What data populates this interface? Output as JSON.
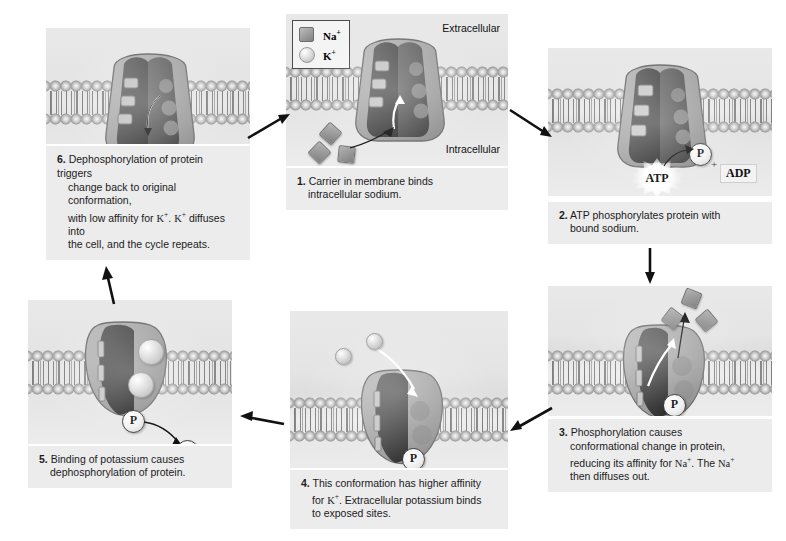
{
  "figure": {
    "legend": {
      "na_label": "Na",
      "na_charge": "+",
      "k_label": "K",
      "k_charge": "+",
      "na_icon": "square-icon",
      "k_icon": "circle-icon"
    },
    "region_labels": {
      "extracellular": "Extracellular",
      "intracellular": "Intracellular"
    },
    "molecules": {
      "atp": "ATP",
      "adp": "ADP",
      "phosphate": "P",
      "plus": "+"
    }
  },
  "steps": [
    {
      "number": "1.",
      "line1": "Carrier in membrane binds",
      "line2": "intracellular sodium.",
      "line3": "",
      "line4": ""
    },
    {
      "number": "2.",
      "line1": "ATP phosphorylates protein with",
      "line2": "bound sodium.",
      "line3": "",
      "line4": ""
    },
    {
      "number": "3.",
      "line1": "Phosphorylation causes",
      "line2": "conformational change in protein,",
      "line3_a": "reducing its affinity for ",
      "line3_ion1": "Na",
      "line3_b": ". The ",
      "line3_ion2": "Na",
      "line4": "then diffuses out."
    },
    {
      "number": "4.",
      "line1": "This conformation has higher affinity",
      "line2_a": "for ",
      "line2_ion": "K",
      "line2_b": ". Extracellular potassium binds",
      "line3": "to exposed sites.",
      "line4": ""
    },
    {
      "number": "5.",
      "line1": "Binding of potassium causes",
      "line2": "dephosphorylation of protein.",
      "line3": "",
      "line4": ""
    },
    {
      "number": "6.",
      "line1": "Dephosphorylation of protein triggers",
      "line2": "change back to original conformation,",
      "line3_a": "with low affinity for ",
      "line3_ion1": "K",
      "line3_b": ". ",
      "line3_ion2": "K",
      "line3_c": " diffuses into",
      "line4": "the cell, and the cycle repeats."
    }
  ],
  "colors": {
    "panel_background": "#e6e6e6",
    "caption_background": "#ececed",
    "protein_outer": "#a6a6a6",
    "protein_inner": "#5a5a5a",
    "arrow": "#111111",
    "text": "#1b1b1b"
  }
}
